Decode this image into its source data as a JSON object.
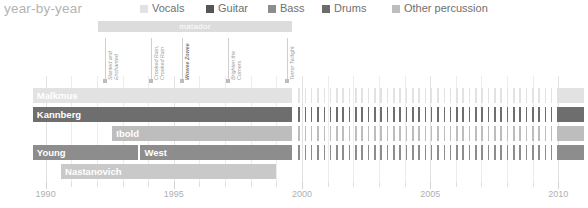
{
  "header": {
    "title": "year-by-year"
  },
  "legend": {
    "position": "top-right",
    "items": [
      {
        "label": "Vocals",
        "color": "#e2e2e2",
        "x": 140
      },
      {
        "label": "Guitar",
        "color": "#555555",
        "x": 206
      },
      {
        "label": "Bass",
        "color": "#8d8d8d",
        "x": 268
      },
      {
        "label": "Drums",
        "color": "#6b6b6b",
        "x": 322
      },
      {
        "label": "Other percussion",
        "color": "#bdbdbd",
        "x": 392
      }
    ]
  },
  "label_band": {
    "name": "matador",
    "start_year": 1992.05,
    "end_year": 1999.6,
    "color": "#dcdcdc",
    "text_color": "#ffffff"
  },
  "albums": [
    {
      "title_lines": [
        "Slanted and",
        "Enchanted"
      ],
      "year": 1992.3,
      "bold": false
    },
    {
      "title_lines": [
        "Crooked Rain,",
        "Crooked Rain"
      ],
      "year": 1994.1,
      "bold": false
    },
    {
      "title_lines": [
        "Wowee Zowee"
      ],
      "year": 1995.3,
      "bold": true
    },
    {
      "title_lines": [
        "Brighten the",
        "Corners"
      ],
      "year": 1997.1,
      "bold": false
    },
    {
      "title_lines": [
        "Terror Twilight"
      ],
      "year": 1999.4,
      "bold": false
    }
  ],
  "axis": {
    "min_year": 1989.0,
    "max_year": 2011.0,
    "major_ticks": [
      1990,
      1995,
      2000,
      2005,
      2010
    ],
    "minor_step": 1,
    "tick_labels": [
      "1990",
      "1995",
      "2000",
      "2005",
      "2010"
    ]
  },
  "chart_data": {
    "type": "bar",
    "title": "year-by-year",
    "xlabel": "",
    "ylabel": "",
    "xlim": [
      1989.0,
      2011.0
    ],
    "grid": true,
    "legend_position": "top-right",
    "categories": [
      "Malkmus",
      "Kannberg",
      "Ibold",
      "Young",
      "West",
      "Nastanovich"
    ],
    "series": [
      {
        "name": "Vocals",
        "color": "#e2e2e2"
      },
      {
        "name": "Guitar",
        "color": "#555555"
      },
      {
        "name": "Bass",
        "color": "#8d8d8d"
      },
      {
        "name": "Drums",
        "color": "#6b6b6b"
      },
      {
        "name": "Other percussion",
        "color": "#bdbdbd"
      }
    ],
    "rows": [
      {
        "member": "Malkmus",
        "top": 0,
        "segments": [
          {
            "label": "Malkmus",
            "role": "Vocals",
            "color": "#e2e2e2",
            "start": 1989.5,
            "end": 1999.6,
            "dense": true
          },
          {
            "label": "",
            "role": "Vocals",
            "color": "#e2e2e2",
            "start": 1999.8,
            "end": 2009.9,
            "dense": false
          },
          {
            "label": "",
            "role": "Vocals",
            "color": "#e2e2e2",
            "start": 2009.95,
            "end": 2011.0,
            "dense": true
          }
        ]
      },
      {
        "member": "Kannberg",
        "top": 19,
        "segments": [
          {
            "label": "Kannberg",
            "role": "Guitar",
            "color": "#6e6e6e",
            "start": 1989.5,
            "end": 1999.6,
            "dense": true
          },
          {
            "label": "",
            "role": "Guitar",
            "color": "#6e6e6e",
            "start": 1999.8,
            "end": 2009.9,
            "dense": false
          },
          {
            "label": "",
            "role": "Guitar",
            "color": "#6e6e6e",
            "start": 2009.95,
            "end": 2011.0,
            "dense": true
          }
        ]
      },
      {
        "member": "Ibold",
        "top": 38,
        "segments": [
          {
            "label": "Ibold",
            "role": "Bass",
            "color": "#bdbdbd",
            "start": 1992.6,
            "end": 1999.6,
            "dense": true
          },
          {
            "label": "",
            "role": "Bass",
            "color": "#bdbdbd",
            "start": 1999.8,
            "end": 2009.9,
            "dense": false
          },
          {
            "label": "",
            "role": "Bass",
            "color": "#bdbdbd",
            "start": 2009.95,
            "end": 2011.0,
            "dense": true
          }
        ]
      },
      {
        "member": "Young",
        "top": 57,
        "segments": [
          {
            "label": "Young",
            "role": "Drums",
            "color": "#8d8d8d",
            "start": 1989.5,
            "end": 1993.6,
            "dense": true
          },
          {
            "label": "West",
            "role": "Drums",
            "color": "#8d8d8d",
            "start": 1993.7,
            "end": 1999.6,
            "dense": true
          },
          {
            "label": "",
            "role": "Drums",
            "color": "#8d8d8d",
            "start": 1999.8,
            "end": 2009.9,
            "dense": false
          },
          {
            "label": "",
            "role": "Drums",
            "color": "#8d8d8d",
            "start": 2009.95,
            "end": 2011.0,
            "dense": true
          }
        ]
      },
      {
        "member": "Nastanovich",
        "top": 76,
        "segments": [
          {
            "label": "Nastanovich",
            "role": "Other percussion",
            "color": "#c9c9c9",
            "start": 1990.6,
            "end": 1999.0,
            "dense": true
          }
        ]
      }
    ]
  }
}
